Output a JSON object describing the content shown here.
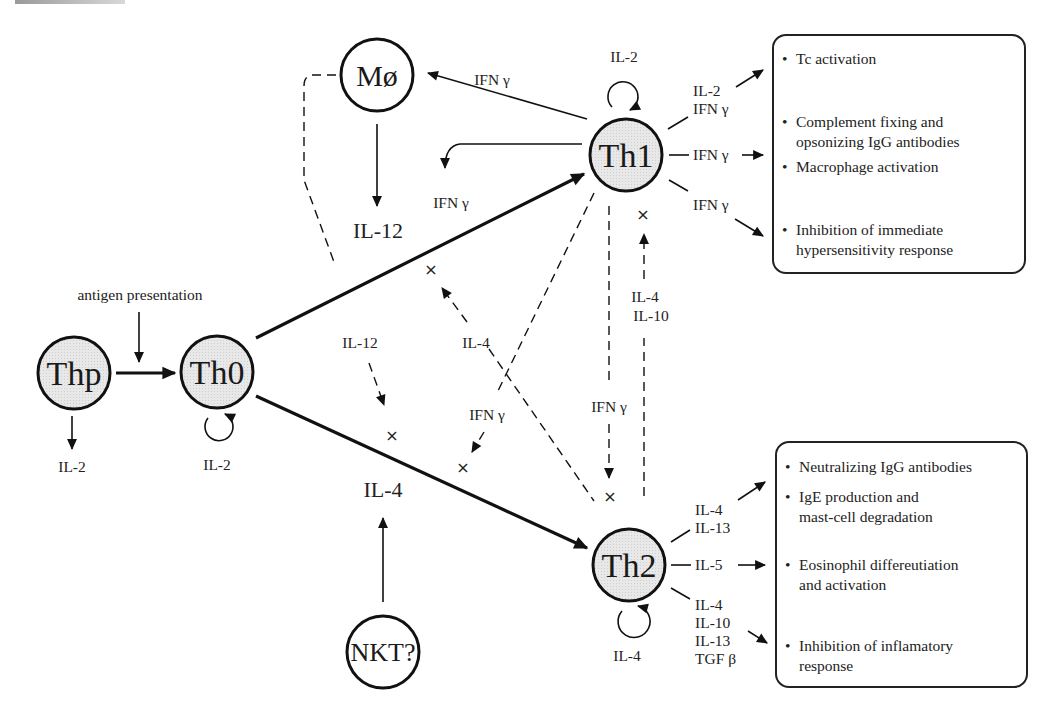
{
  "nodes": {
    "thp": {
      "label": "Thp",
      "fill": "#e6e6e6"
    },
    "th0": {
      "label": "Th0",
      "fill": "#e6e6e6"
    },
    "th1": {
      "label": "Th1",
      "fill": "#e6e6e6"
    },
    "th2": {
      "label": "Th2",
      "fill": "#e6e6e6"
    },
    "macrophage": {
      "label": "Mø",
      "fill": "#ffffff"
    },
    "nkt": {
      "label": "NKT?",
      "fill": "#ffffff"
    }
  },
  "labels": {
    "antigen_presentation": "antigen presentation",
    "thp_output": "IL-2",
    "th0_autocrine": "IL-2",
    "th1_autocrine": "IL-2",
    "th2_autocrine": "IL-4",
    "macrophage_output": "IL-12",
    "nkt_output": "IL-4",
    "th1_to_macrophage": "IFN γ",
    "th1_self_ifn": "IFN γ",
    "il12_inhibit": "IL-12",
    "il4_inhibit_th1path": "IL-4",
    "ifn_inhibit_th2path": "IFN γ",
    "ifn_th1_to_th2": "IFN γ",
    "th2_to_th1_line1": "IL-4",
    "th2_to_th1_line2": "IL-10"
  },
  "th1_outputs": [
    {
      "cytokines": [
        "IL-2",
        "IFN γ"
      ]
    },
    {
      "cytokines": [
        "IFN γ"
      ]
    },
    {
      "cytokines": [
        "IFN γ"
      ]
    }
  ],
  "th2_outputs": [
    {
      "cytokines": [
        "IL-4",
        "IL-13"
      ]
    },
    {
      "cytokines": [
        "IL-5"
      ]
    },
    {
      "cytokines": [
        "IL-4",
        "IL-10",
        "IL-13",
        "TGF β"
      ]
    }
  ],
  "th1_effects": [
    "Tc activation",
    "Complement fixing and\nopsonizing IgG antibodies",
    "Macrophage activation",
    "Inhibition of immediate\nhypersensitivity response"
  ],
  "th2_effects": [
    "Neutralizing IgG antibodies",
    "IgE production and\nmast-cell degradation",
    "Eosinophil differeutiation\nand activation",
    "Inhibition of inflamatory\nresponse"
  ],
  "inhibition_symbol": "×",
  "bullet": "•"
}
